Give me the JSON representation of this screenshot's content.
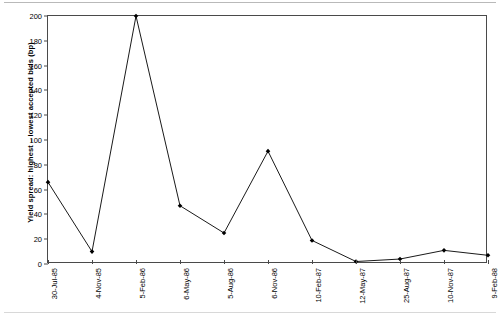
{
  "chart_data": {
    "type": "line",
    "title": "",
    "subtitle": "",
    "xlabel": "",
    "ylabel": "Yield spread: highest – lowest accepted bids (bp)",
    "categories": [
      "30-Jul-85",
      "4-Nov-85",
      "5-Feb-86",
      "6-May-86",
      "5-Aug-86",
      "6-Nov-86",
      "10-Feb-87",
      "12-May-87",
      "25-Aug-87",
      "10-Nov-87",
      "9-Feb-88"
    ],
    "values": [
      66,
      10,
      200,
      47,
      25,
      91,
      19,
      2,
      4,
      11,
      7
    ],
    "ylim": [
      0,
      200
    ],
    "ytick_labels": [
      "0",
      "20",
      "40",
      "60",
      "80",
      "100",
      "120",
      "140",
      "160",
      "180",
      "200"
    ],
    "ytick_values": [
      0,
      20,
      40,
      60,
      80,
      100,
      120,
      140,
      160,
      180,
      200
    ],
    "grid": false,
    "legend": false,
    "legend_position": "none",
    "marker": "filled-diamond",
    "line_color": "#1a1a1a",
    "marker_color": "#000000",
    "axis_color": "#4a4a4a",
    "background_color": "#ffffff"
  }
}
